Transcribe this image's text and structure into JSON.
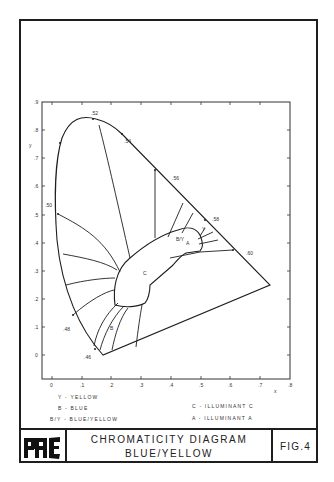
{
  "title_block": {
    "title_line1": "CHROMATICITY DIAGRAM",
    "title_line2": "BLUE/YELLOW",
    "figure_label": "FIG.4",
    "logo": "PAC-logo"
  },
  "legend": [
    {
      "key": "Y",
      "text": "Y  -  YELLOW"
    },
    {
      "key": "B",
      "text": "B  -  BLUE"
    },
    {
      "key": "B/Y",
      "text": "B/Y  -  BLUE/YELLOW"
    },
    {
      "key": "C",
      "text": "C  -  ILLUMINANT C"
    },
    {
      "key": "A",
      "text": "A  -  ILLUMINANT A"
    }
  ],
  "diagram": {
    "type": "CIE 1931 chromaticity diagram",
    "x_axis": {
      "label": "x",
      "ticks": [
        "0",
        ".1",
        ".2",
        ".3",
        ".4",
        ".5",
        ".6",
        ".7",
        ".8"
      ]
    },
    "y_axis": {
      "label": "y",
      "ticks": [
        "0",
        ".1",
        ".2",
        ".3",
        ".4",
        ".5",
        ".6",
        ".7",
        ".8",
        ".9"
      ]
    },
    "wavelength_labels": [
      ".52",
      ".54",
      ".56",
      ".58",
      ".60",
      ".50",
      ".48",
      ".46"
    ],
    "region_labels": {
      "illuminant_c": "C",
      "illuminant_a": "A",
      "blue": "B",
      "yellow": "Y",
      "blue_yellow": "B/Y"
    },
    "colors": {
      "ink": "#1e1e1e",
      "paper": "#ffffff"
    }
  }
}
